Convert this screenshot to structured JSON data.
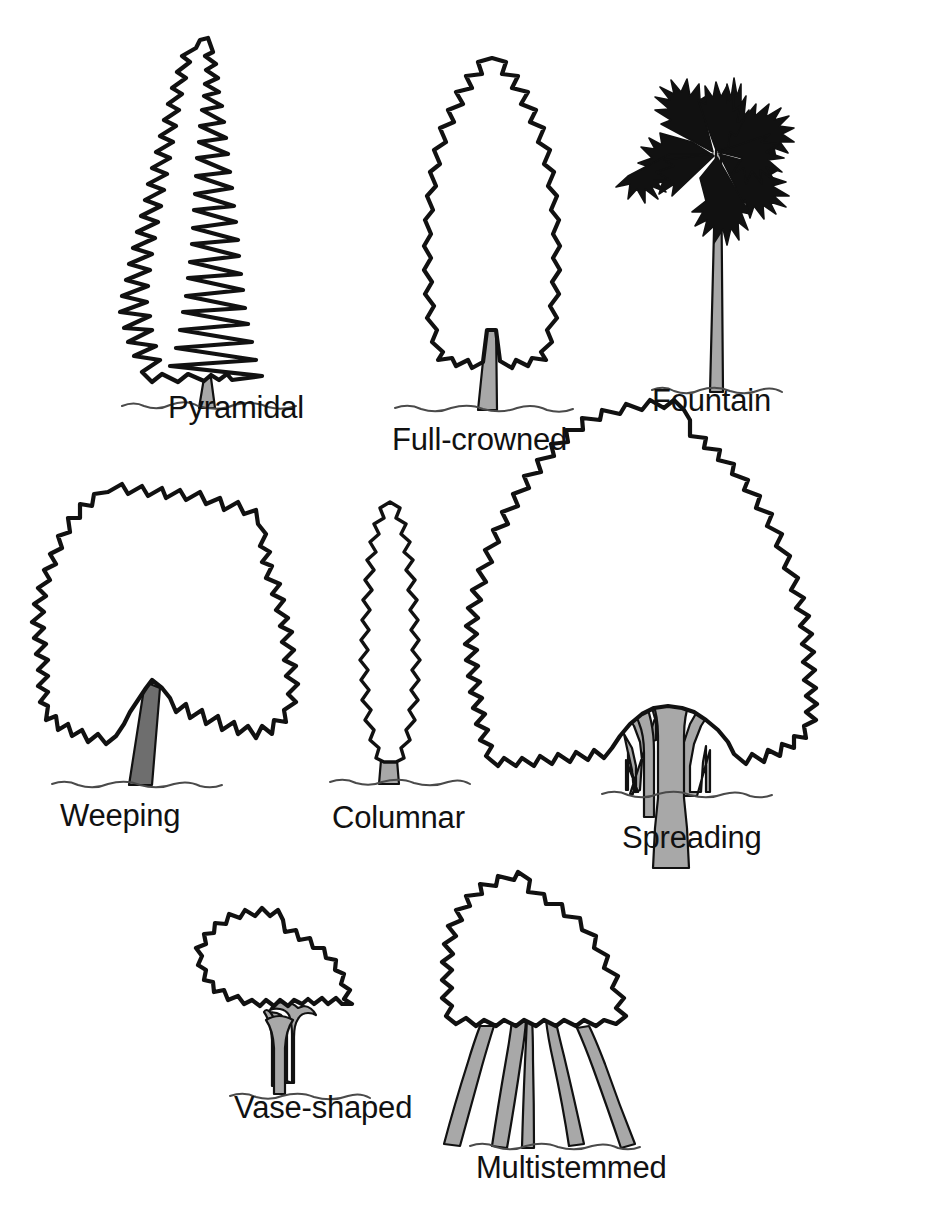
{
  "figure": {
    "kind": "tree-forms-diagram",
    "background_color": "#ffffff",
    "outline_color": "#111111",
    "trunk_fill_light": "#a8a8a8",
    "trunk_fill_dark": "#6e6e6e",
    "ground_line_color": "#4a4a4a",
    "width": 932,
    "height": 1218
  },
  "trees": [
    {
      "id": "pyramidal",
      "label": "Pyramidal",
      "row": 1,
      "column": 1,
      "crown_style": "jagged-conifer",
      "trunk_shade": "light"
    },
    {
      "id": "full-crowned",
      "label": "Full-crowned",
      "row": 1,
      "column": 2,
      "crown_style": "tall-oval-lobed",
      "trunk_shade": "light"
    },
    {
      "id": "fountain",
      "label": "Fountain",
      "row": 1,
      "column": 3,
      "crown_style": "palm-fronds",
      "frond_count": 9,
      "trunk_shade": "light"
    },
    {
      "id": "weeping",
      "label": "Weeping",
      "row": 2,
      "column": 1,
      "crown_style": "broad-drooping",
      "trunk_shade": "dark"
    },
    {
      "id": "columnar",
      "label": "Columnar",
      "row": 2,
      "column": 2,
      "crown_style": "narrow-spindle",
      "trunk_shade": "light"
    },
    {
      "id": "spreading",
      "label": "Spreading",
      "row": 2,
      "column": 3,
      "crown_style": "wide-dome",
      "branch_count": 3,
      "trunk_shade": "light"
    },
    {
      "id": "vase-shaped",
      "label": "Vase-shaped",
      "row": 3,
      "column": 1,
      "crown_style": "small-rounded-on-tall-stem",
      "trunk_shade": "light"
    },
    {
      "id": "multistemmed",
      "label": "Multistemmed",
      "row": 3,
      "column": 2,
      "crown_style": "rounded-dome",
      "stem_count": 5,
      "trunk_shade": "light"
    }
  ]
}
